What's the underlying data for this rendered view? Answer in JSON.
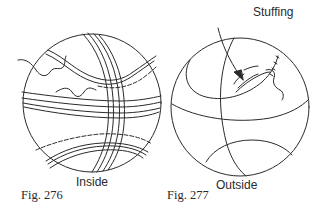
{
  "figures": [
    {
      "id": "fig-276",
      "caption": "Fig. 276",
      "label": "Inside",
      "subject": "ball-inside-view"
    },
    {
      "id": "fig-277",
      "caption": "Fig. 277",
      "label": "Outside",
      "subject": "ball-outside-view",
      "annotation": "Stuffing"
    }
  ],
  "colors": {
    "ink": "#2a2a2a",
    "background": "#ffffff"
  }
}
